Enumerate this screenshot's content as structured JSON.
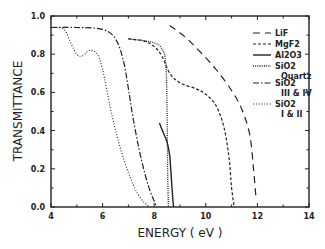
{
  "chart_data": {
    "type": "line",
    "title": "",
    "xlabel": "ENERGY ( eV )",
    "ylabel": "TRANSMITTANCE",
    "xlim": [
      4,
      14
    ],
    "ylim": [
      0.0,
      1.0
    ],
    "xticks": [
      "4",
      "6",
      "8",
      "10",
      "12",
      "14"
    ],
    "yticks": [
      "0.0",
      "0.2",
      "0.4",
      "0.6",
      "0.8",
      "1.0"
    ],
    "grid": false,
    "legend_position": "upper right inside",
    "series": [
      {
        "name": "LiF",
        "style": "long-dash",
        "x": [
          8.6,
          9.2,
          9.8,
          10.4,
          11.0,
          11.4,
          11.7,
          11.85,
          11.95
        ],
        "y": [
          0.95,
          0.89,
          0.81,
          0.72,
          0.61,
          0.51,
          0.38,
          0.2,
          0.04
        ]
      },
      {
        "name": "MgF2",
        "style": "short-dash",
        "x": [
          7.0,
          7.6,
          8.0,
          8.3,
          8.6,
          9.0,
          9.6,
          10.0,
          10.4,
          10.7,
          10.9,
          11.0,
          11.1
        ],
        "y": [
          0.88,
          0.87,
          0.84,
          0.79,
          0.7,
          0.65,
          0.62,
          0.59,
          0.53,
          0.42,
          0.26,
          0.1,
          0.0
        ]
      },
      {
        "name": "Al2O3",
        "style": "solid",
        "x": [
          8.2,
          8.35,
          8.5,
          8.6,
          8.65,
          8.7,
          8.75
        ],
        "y": [
          0.44,
          0.39,
          0.34,
          0.27,
          0.18,
          0.08,
          0.0
        ]
      },
      {
        "name": "SiO2 Quartz",
        "style": "fine-dot",
        "x": [
          7.0,
          7.6,
          8.0,
          8.3,
          8.45,
          8.5,
          8.52,
          8.55
        ],
        "y": [
          0.88,
          0.87,
          0.86,
          0.83,
          0.75,
          0.5,
          0.2,
          0.0
        ]
      },
      {
        "name": "SiO2 III & IV",
        "style": "dash-dot",
        "x": [
          4.0,
          5.0,
          6.0,
          6.5,
          6.8,
          7.0,
          7.2,
          7.5,
          7.8,
          8.1
        ],
        "y": [
          0.94,
          0.94,
          0.93,
          0.88,
          0.77,
          0.62,
          0.45,
          0.25,
          0.1,
          0.0
        ]
      },
      {
        "name": "SiO2 I & II",
        "style": "dotted",
        "x": [
          4.0,
          4.5,
          4.8,
          5.0,
          5.2,
          5.5,
          5.8,
          6.0,
          6.3,
          6.6,
          7.0,
          7.4,
          7.8
        ],
        "y": [
          0.94,
          0.93,
          0.85,
          0.8,
          0.79,
          0.82,
          0.8,
          0.72,
          0.52,
          0.35,
          0.18,
          0.06,
          0.0
        ]
      }
    ]
  },
  "legend": [
    {
      "label": "LiF",
      "sub": ""
    },
    {
      "label": "MgF2",
      "sub": ""
    },
    {
      "label": "Al2O3",
      "sub": ""
    },
    {
      "label": "SiO2",
      "sub": "Quartz"
    },
    {
      "label": "SiO2",
      "sub": "III & IV"
    },
    {
      "label": "SiO2",
      "sub": "I & II"
    }
  ],
  "colors": {
    "line": "#222222",
    "axis": "#222222",
    "background": "#ffffff"
  }
}
